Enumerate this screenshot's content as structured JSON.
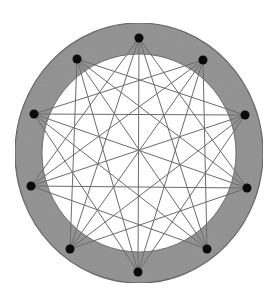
{
  "diagram": {
    "type": "circulant-graph-on-ring",
    "ring": {
      "center": [
        139,
        153
      ],
      "outer_radius": [
        124,
        130
      ],
      "inner_radius": [
        97,
        99
      ],
      "fill": "#8e8e8e",
      "stroke": "#5a5a5a",
      "inner_fill": "#ffffff"
    },
    "node_color": "#0a0a0a",
    "node_radius": 4.5,
    "edge_color": "#6b6b6b",
    "edge_width": 1,
    "nodes": [
      {
        "id": 0,
        "x": 139,
        "y": 38
      },
      {
        "id": 1,
        "x": 203,
        "y": 60
      },
      {
        "id": 2,
        "x": 245,
        "y": 115
      },
      {
        "id": 3,
        "x": 247,
        "y": 188
      },
      {
        "id": 4,
        "x": 207,
        "y": 249
      },
      {
        "id": 5,
        "x": 138,
        "y": 272
      },
      {
        "id": 6,
        "x": 70,
        "y": 249
      },
      {
        "id": 7,
        "x": 31,
        "y": 186
      },
      {
        "id": 8,
        "x": 34,
        "y": 114
      },
      {
        "id": 9,
        "x": 77,
        "y": 59
      }
    ],
    "connection_distances": [
      3,
      4,
      5
    ]
  }
}
